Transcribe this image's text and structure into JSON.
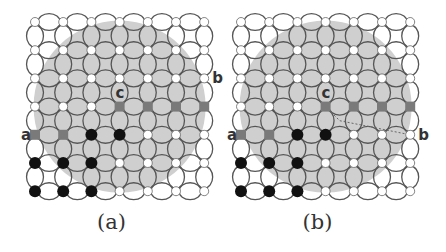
{
  "colors": {
    "background": "#ffffff",
    "disk_fill": "#cfcfcf",
    "link_stroke": "#555555",
    "node_white": "#ffffff",
    "node_black": "#111111",
    "node_gray": "#7a7a7a",
    "label": "#333333"
  },
  "grid": {
    "rows": 7,
    "cols": 7,
    "spacing": 28.2
  },
  "node_states": [
    [
      "w",
      "w",
      "w",
      "w",
      "w",
      "w",
      "w"
    ],
    [
      "w",
      "w",
      "w",
      "w",
      "w",
      "w",
      "w"
    ],
    [
      "w",
      "w",
      "w",
      "w",
      "w",
      "w",
      "w"
    ],
    [
      "w",
      "w",
      "w",
      "g",
      "g",
      "g",
      "g"
    ],
    [
      "g",
      "g",
      "k",
      "k",
      "w",
      "w",
      "w"
    ],
    [
      "k",
      "k",
      "k",
      "w",
      "w",
      "w",
      "w"
    ],
    [
      "k",
      "k",
      "k",
      "w",
      "w",
      "w",
      "w"
    ]
  ],
  "panels": [
    {
      "id": "a",
      "caption": "(a)",
      "origin_x": 35,
      "labels": [
        {
          "text": "a",
          "row": 4,
          "col": 0,
          "side": "left"
        },
        {
          "text": "b",
          "row": 2,
          "col": 6,
          "side": "right"
        },
        {
          "text": "c",
          "row": 3,
          "col": 3,
          "side": "above"
        }
      ],
      "path": null
    },
    {
      "id": "b",
      "caption": "(b)",
      "origin_x": 241,
      "labels": [
        {
          "text": "a",
          "row": 4,
          "col": 0,
          "side": "left"
        },
        {
          "text": "b",
          "row": 4,
          "col": 6,
          "side": "right"
        },
        {
          "text": "c",
          "row": 3,
          "col": 3,
          "side": "above"
        }
      ],
      "path": {
        "from": [
          3,
          3
        ],
        "to": [
          4,
          6
        ],
        "style": "dashed"
      }
    }
  ]
}
